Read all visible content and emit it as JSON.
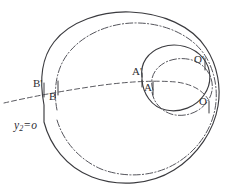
{
  "figure": {
    "background_color": "#ffffff",
    "stroke_color": "#3b3b3f",
    "width": 237,
    "height": 191,
    "labels": {
      "a_prime": "A'",
      "a": "A",
      "b_prime": "B'",
      "b": "B",
      "o_prime": "O'",
      "o": "O",
      "equation_y": "y",
      "equation_sub": "2",
      "equation_op": "=",
      "equation_value": "o"
    },
    "curves": [
      {
        "name": "outer-spiral-solid",
        "style": "solid",
        "description": "large outer spiral turn, solid line"
      },
      {
        "name": "outer-spiral-dashdot",
        "style": "dash-dot",
        "description": "large outer spiral turn, dash-dot line, inside the solid one"
      },
      {
        "name": "inner-loop-solid",
        "style": "solid",
        "description": "inner small loop of the spiral, solid line"
      },
      {
        "name": "inner-loop-dashdot",
        "style": "dash-dot",
        "description": "inner small loop of the spiral, dash-dot line"
      },
      {
        "name": "chord-dashed",
        "style": "dashed",
        "description": "dashed chord running from lower-left through B', B, A', A toward O"
      }
    ],
    "points": [
      {
        "name": "A-prime",
        "label": "A'",
        "x": 140,
        "y": 73
      },
      {
        "name": "A",
        "label": "A",
        "x": 151,
        "y": 88
      },
      {
        "name": "B-prime",
        "label": "B'",
        "x": 42,
        "y": 85
      },
      {
        "name": "B",
        "label": "B",
        "x": 57,
        "y": 97
      },
      {
        "name": "O-prime",
        "label": "O'",
        "x": 199,
        "y": 60
      },
      {
        "name": "O",
        "label": "O",
        "x": 205,
        "y": 100
      }
    ]
  }
}
